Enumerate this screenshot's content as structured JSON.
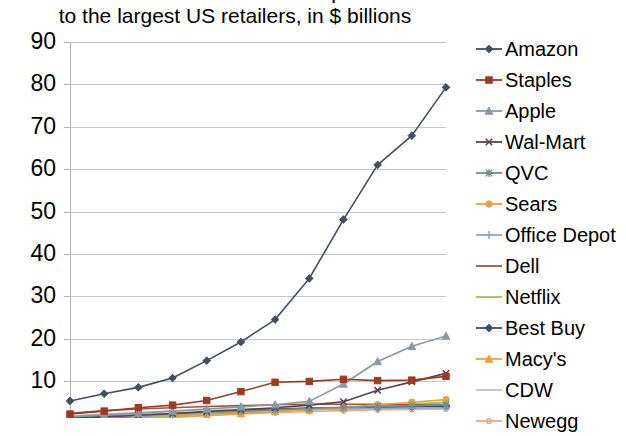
{
  "chart_data": {
    "type": "line",
    "title": "E-commerce revenue compared to the largest US retailers, in $ billions",
    "title_line1": "E-commerce revenue compared",
    "title_line2": "to the largest US retailers, in $ billions",
    "xlabel": "",
    "ylabel": "",
    "ylim": [
      0,
      90
    ],
    "ytick_labels": [
      "90",
      "80",
      "70",
      "60",
      "50",
      "40",
      "30",
      "20",
      "10"
    ],
    "ytick_values": [
      90,
      80,
      70,
      60,
      50,
      40,
      30,
      20,
      10
    ],
    "grid": true,
    "legend_position": "right",
    "x": [
      1,
      2,
      3,
      4,
      5,
      6,
      7,
      8,
      9,
      10,
      11,
      12
    ],
    "series": [
      {
        "name": "Amazon",
        "color": "#3f5063",
        "marker": "diamond",
        "values": [
          5.3,
          7.0,
          8.5,
          10.7,
          14.8,
          19.2,
          24.5,
          34.2,
          48.1,
          61.0,
          67.9,
          79.3
        ]
      },
      {
        "name": "Staples",
        "color": "#9e3a20",
        "marker": "square",
        "values": [
          2.2,
          2.9,
          3.7,
          4.3,
          5.4,
          7.5,
          9.7,
          9.9,
          10.4,
          10.1,
          10.2,
          11.1
        ]
      },
      {
        "name": "Apple",
        "color": "#8899a6",
        "marker": "triangle",
        "values": [
          1.6,
          2.0,
          2.4,
          2.9,
          3.4,
          3.9,
          4.4,
          5.2,
          9.3,
          14.6,
          18.2,
          20.6
        ]
      },
      {
        "name": "Wal-Mart",
        "color": "#5c4050",
        "marker": "x",
        "values": [
          1.2,
          1.5,
          1.9,
          2.3,
          2.8,
          3.2,
          3.7,
          4.3,
          5.1,
          7.8,
          9.8,
          11.8
        ]
      },
      {
        "name": "QVC",
        "color": "#6e8f8f",
        "marker": "asterisk",
        "values": [
          1.4,
          1.7,
          2.0,
          2.3,
          2.6,
          2.9,
          3.2,
          3.5,
          3.8,
          4.0,
          4.2,
          4.4
        ]
      },
      {
        "name": "Sears",
        "color": "#e8a33d",
        "marker": "circle",
        "values": [
          1.3,
          1.6,
          1.9,
          2.1,
          2.4,
          2.6,
          2.9,
          3.2,
          3.8,
          4.4,
          5.0,
          5.6
        ]
      },
      {
        "name": "Office Depot",
        "color": "#8fa8c8",
        "marker": "plus",
        "values": [
          1.1,
          1.4,
          1.7,
          2.0,
          2.4,
          2.7,
          3.0,
          3.2,
          3.4,
          3.5,
          3.6,
          3.7
        ]
      },
      {
        "name": "Dell",
        "color": "#a0563c",
        "marker": "none",
        "values": [
          2.4,
          3.0,
          3.4,
          3.7,
          4.0,
          4.2,
          4.4,
          4.5,
          4.5,
          4.5,
          4.4,
          4.3
        ]
      },
      {
        "name": "Netflix",
        "color": "#b5b84a",
        "marker": "none",
        "values": [
          0.6,
          0.9,
          1.3,
          1.7,
          2.1,
          2.5,
          2.9,
          3.3,
          3.7,
          4.1,
          4.6,
          5.0
        ]
      },
      {
        "name": "Best Buy",
        "color": "#3c4b78",
        "marker": "diamond",
        "values": [
          0.9,
          1.2,
          1.6,
          2.2,
          2.7,
          3.1,
          3.4,
          3.6,
          3.7,
          3.8,
          3.9,
          4.0
        ]
      },
      {
        "name": "Macy's",
        "color": "#e7a33a",
        "marker": "triangle",
        "values": [
          0.5,
          0.8,
          1.1,
          1.5,
          1.9,
          2.3,
          2.8,
          3.2,
          3.6,
          4.0,
          4.4,
          4.9
        ]
      },
      {
        "name": "CDW",
        "color": "#c3c3c3",
        "marker": "dash",
        "values": [
          1.8,
          2.2,
          2.6,
          2.9,
          3.1,
          3.3,
          3.4,
          3.5,
          3.5,
          3.5,
          3.4,
          3.4
        ]
      },
      {
        "name": "Newegg",
        "color": "#e8a98c",
        "marker": "dot",
        "values": [
          0.4,
          0.7,
          1.0,
          1.4,
          1.8,
          2.2,
          2.5,
          2.8,
          3.0,
          3.2,
          3.3,
          3.4
        ]
      }
    ]
  },
  "legend": {
    "items": [
      {
        "label": "Amazon"
      },
      {
        "label": "Staples"
      },
      {
        "label": "Apple"
      },
      {
        "label": "Wal-Mart"
      },
      {
        "label": "QVC"
      },
      {
        "label": "Sears"
      },
      {
        "label": "Office Depot"
      },
      {
        "label": "Dell"
      },
      {
        "label": "Netflix"
      },
      {
        "label": "Best Buy"
      },
      {
        "label": "Macy's"
      },
      {
        "label": "CDW"
      },
      {
        "label": "Newegg"
      }
    ]
  }
}
